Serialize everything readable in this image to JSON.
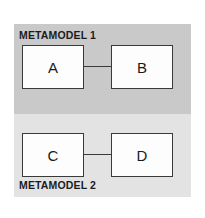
{
  "diagram": {
    "background_color": "#ffffff",
    "panels": [
      {
        "id": "metamodel-1",
        "label": "METAMODEL 1",
        "label_position": "top-left",
        "background_color": "#c9c9c9",
        "boxes": [
          {
            "id": "a",
            "label": "A"
          },
          {
            "id": "b",
            "label": "B"
          }
        ],
        "connector": {
          "from": "A",
          "to": "B",
          "style": "line",
          "color": "#3a3a3a"
        }
      },
      {
        "id": "metamodel-2",
        "label": "METAMODEL 2",
        "label_position": "bottom-left",
        "background_color": "#e3e3e3",
        "boxes": [
          {
            "id": "c",
            "label": "C"
          },
          {
            "id": "d",
            "label": "D"
          }
        ],
        "connector": {
          "from": "C",
          "to": "D",
          "style": "line",
          "color": "#3a3a3a"
        }
      }
    ],
    "box_style": {
      "fill": "#fdfdfd",
      "border_color": "#3a3a3a",
      "text_color": "#1a1a1a"
    }
  }
}
